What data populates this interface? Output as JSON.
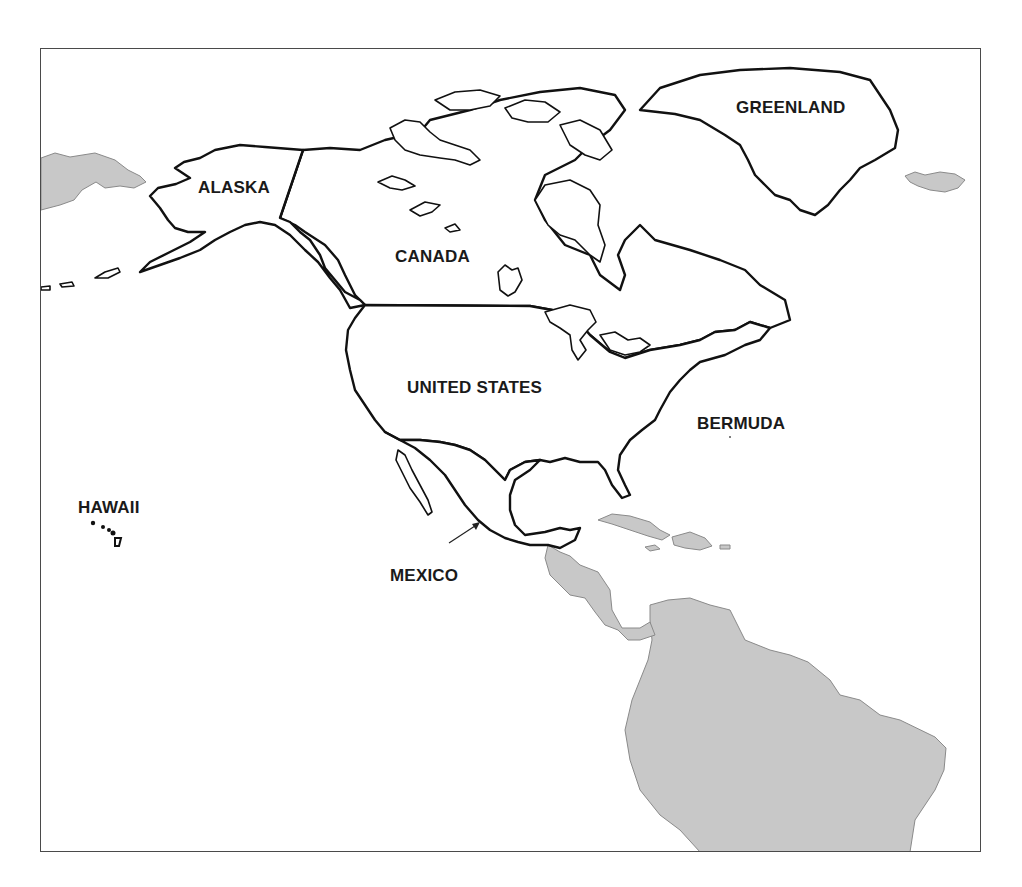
{
  "map": {
    "title": "North America",
    "colors": {
      "highlighted_land": "#ffffff",
      "outline": "#111111",
      "other_land": "#c8c8c8",
      "frame": "#4a4a4a"
    },
    "labels": {
      "greenland": "GREENLAND",
      "alaska": "ALASKA",
      "canada": "CANADA",
      "united_states": "UNITED STATES",
      "bermuda": "BERMUDA",
      "hawaii": "HAWAII",
      "mexico": "MEXICO"
    }
  }
}
